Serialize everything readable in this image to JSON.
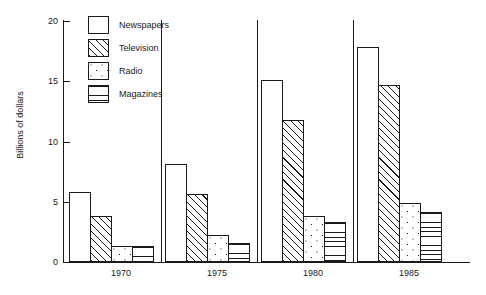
{
  "chart_data": {
    "type": "bar",
    "title": "",
    "subtitle": "",
    "xlabel": "",
    "ylabel": "Billions of dollars",
    "categories": [
      "1970",
      "1975",
      "1980",
      "1985"
    ],
    "ylim": [
      0,
      20
    ],
    "yticks": [
      0,
      5,
      10,
      15,
      20
    ],
    "ytick_labels": [
      "0",
      "5",
      "10",
      "15",
      "20"
    ],
    "grid": false,
    "legend_position": "top-left-inside",
    "series": [
      {
        "name": "Newspapers",
        "pattern": "plain",
        "values": [
          5.8,
          8.1,
          15.0,
          17.8
        ]
      },
      {
        "name": "Television",
        "pattern": "diagonal-hatch",
        "values": [
          3.8,
          5.6,
          11.7,
          14.6
        ]
      },
      {
        "name": "Radio",
        "pattern": "dots",
        "values": [
          1.3,
          2.2,
          3.8,
          4.9
        ]
      },
      {
        "name": "Magazines",
        "pattern": "horizontal-lines",
        "values": [
          1.3,
          1.6,
          3.3,
          4.1
        ]
      }
    ],
    "annotations": []
  },
  "axis": {
    "y_title": "Billions of dollars",
    "y_tick_labels": [
      "20",
      "15",
      "10",
      "5",
      "0"
    ],
    "x_tick_labels": [
      "1970",
      "1975",
      "1980",
      "1985"
    ]
  },
  "legend": {
    "items": [
      {
        "label": "Newspapers",
        "pattern": "plain"
      },
      {
        "label": "Television",
        "pattern": "diagonal-hatch"
      },
      {
        "label": "Radio",
        "pattern": "dots"
      },
      {
        "label": "Magazines",
        "pattern": "horizontal-lines"
      }
    ]
  },
  "colors": {
    "ink": "#1a1a1a",
    "background": "#ffffff"
  }
}
